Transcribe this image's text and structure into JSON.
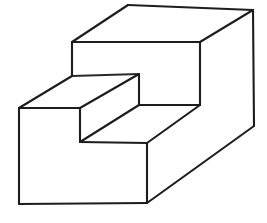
{
  "figure": {
    "background_color": "#ffffff",
    "stroke_color": "#1d1d1d",
    "fill_color": "#ffffff",
    "stroke_width": 2.1,
    "canvas": {
      "width": 267,
      "height": 223
    },
    "projection": "oblique-cabinet",
    "label_text": "",
    "vertices": {
      "top_back_left": [
        128,
        5
      ],
      "top_back_right": [
        253,
        10
      ],
      "top_front_left": [
        72,
        42
      ],
      "top_front_right": [
        200,
        42
      ],
      "upper_riser_bl": [
        72,
        76
      ],
      "upper_riser_br": [
        200,
        105
      ],
      "tread_front_left": [
        139,
        74
      ],
      "tread_front_right": [
        200,
        105
      ],
      "step_back_left": [
        80,
        108
      ],
      "step_front_left": [
        19,
        108
      ],
      "step_nose_left": [
        80,
        142
      ],
      "step_nose_right": [
        147,
        143
      ],
      "lower_front_bl": [
        19,
        204
      ],
      "lower_front_br": [
        147,
        203
      ],
      "lower_back_right": [
        254,
        126
      ],
      "mid_riser_top": [
        139,
        105
      ]
    },
    "faces": [
      {
        "name": "top-face",
        "points": "128,5 253,10 200,42 72,42"
      },
      {
        "name": "upper-front-face",
        "points": "72,42 200,42 200,105 139,105 139,74 72,76"
      },
      {
        "name": "upper-tread-face",
        "points": "72,76 139,74 80,108 19,108"
      },
      {
        "name": "step-riser-face",
        "points": "80,108 139,74 139,105 80,142"
      },
      {
        "name": "lower-tread-face",
        "points": "80,142 139,105 200,105 147,143"
      },
      {
        "name": "lower-front-face",
        "points": "19,108 80,108 80,142 147,143 147,203 19,204"
      },
      {
        "name": "right-side-face",
        "points": "200,42 253,10 254,126 147,203 147,143 200,105"
      }
    ],
    "edges": [
      {
        "name": "top-back-edge",
        "d": "M128,5 L253,10"
      },
      {
        "name": "top-left-receding-edge",
        "d": "M128,5 L72,42"
      },
      {
        "name": "top-right-receding-edge",
        "d": "M253,10 L200,42"
      },
      {
        "name": "top-front-edge",
        "d": "M72,42 L200,42"
      },
      {
        "name": "upper-left-vertical-edge",
        "d": "M72,42 L72,76"
      },
      {
        "name": "upper-right-vertical-edge",
        "d": "M200,42 L200,105"
      },
      {
        "name": "right-outer-vertical-edge",
        "d": "M253,10 L254,126"
      },
      {
        "name": "upper-tread-receding-edge",
        "d": "M72,76 L139,74"
      },
      {
        "name": "tread-front-edge",
        "d": "M139,74 L139,105"
      },
      {
        "name": "tread-right-edge",
        "d": "M139,105 L200,105"
      },
      {
        "name": "upper-tread-left-edge",
        "d": "M72,76 L19,108"
      },
      {
        "name": "upper-tread-bottom-edge",
        "d": "M19,108 L80,108"
      },
      {
        "name": "step-riser-diagonal-edge",
        "d": "M80,108 L139,74"
      },
      {
        "name": "step-riser-vertical-edge",
        "d": "M80,108 L80,142"
      },
      {
        "name": "lower-tread-receding-edge",
        "d": "M80,142 L139,105"
      },
      {
        "name": "lower-tread-front-edge",
        "d": "M80,142 L147,143"
      },
      {
        "name": "lower-tread-right-edge",
        "d": "M147,143 L200,105"
      },
      {
        "name": "front-left-vertical-edge",
        "d": "M19,108 L19,204"
      },
      {
        "name": "front-bottom-edge",
        "d": "M19,204 L147,203"
      },
      {
        "name": "front-right-vertical-edge",
        "d": "M147,143 L147,203"
      },
      {
        "name": "bottom-right-receding-edge",
        "d": "M147,203 L254,126"
      }
    ]
  }
}
